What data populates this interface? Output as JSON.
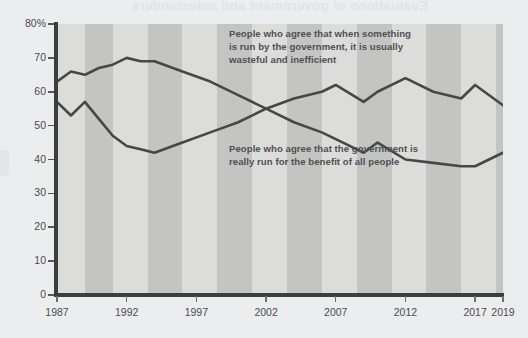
{
  "page": {
    "bleed_through_title": "Evaluations of government and sidestanders",
    "background_color": "#ecedee"
  },
  "chart_area": {
    "plot_background": "#d7d8d6",
    "band_light": "#dcdddb",
    "band_dark": "#c4c5c2",
    "axis_color": "#3d3d3d",
    "line_color": "#474749"
  },
  "annotations": {
    "upper": "People who agree that when something is run by the government, it is usually wasteful and inefficient",
    "lower": "People who agree that the government is really run for the benefit of all people"
  },
  "chart_data": {
    "type": "line",
    "title": "Evaluations of government and sidestanders",
    "xlabel": "",
    "ylabel": "",
    "ylim": [
      0,
      80
    ],
    "xlim": [
      1987,
      2019
    ],
    "grid": false,
    "legend": "annotations on plot",
    "y_ticks": [
      "0",
      "10",
      "20",
      "30",
      "40",
      "50",
      "60",
      "70",
      "80%"
    ],
    "y_tick_values": [
      0,
      10,
      20,
      30,
      40,
      50,
      60,
      70,
      80
    ],
    "x_ticks": [
      "1987",
      "1992",
      "1997",
      "2002",
      "2007",
      "2012",
      "2017",
      "2019"
    ],
    "x_tick_values": [
      1987,
      1992,
      1997,
      2002,
      2007,
      2012,
      2017,
      2019
    ],
    "series": [
      {
        "name": "People who agree that when something is run by the government, it is usually wasteful and inefficient",
        "color": "#474749",
        "x": [
          1987,
          1988,
          1989,
          1990,
          1991,
          1992,
          1993,
          1994,
          1996,
          1998,
          2000,
          2002,
          2004,
          2006,
          2008,
          2009,
          2010,
          2012,
          2014,
          2016,
          2017,
          2019
        ],
        "values": [
          63,
          66,
          65,
          67,
          68,
          70,
          69,
          69,
          66,
          63,
          59,
          55,
          51,
          48,
          44,
          42,
          45,
          40,
          39,
          38,
          38,
          42
        ]
      },
      {
        "name": "People who agree that the government is really run for the benefit of all people",
        "color": "#474749",
        "x": [
          1987,
          1988,
          1989,
          1990,
          1991,
          1992,
          1993,
          1994,
          1996,
          1998,
          2000,
          2002,
          2004,
          2006,
          2007,
          2009,
          2010,
          2012,
          2014,
          2016,
          2017,
          2019
        ],
        "values": [
          57,
          53,
          57,
          52,
          47,
          44,
          43,
          42,
          45,
          48,
          51,
          55,
          58,
          60,
          62,
          57,
          60,
          64,
          60,
          58,
          62,
          56
        ]
      }
    ],
    "crossing_point": {
      "year": 2002,
      "value": 55
    }
  },
  "bands": [
    {
      "start": 1987,
      "end": 1989,
      "shade": "light"
    },
    {
      "start": 1989,
      "end": 1991,
      "shade": "dark"
    },
    {
      "start": 1991,
      "end": 1993.5,
      "shade": "light"
    },
    {
      "start": 1993.5,
      "end": 1996,
      "shade": "dark"
    },
    {
      "start": 1996,
      "end": 1998.5,
      "shade": "light"
    },
    {
      "start": 1998.5,
      "end": 2001,
      "shade": "dark"
    },
    {
      "start": 2001,
      "end": 2003.5,
      "shade": "light"
    },
    {
      "start": 2003.5,
      "end": 2006,
      "shade": "dark"
    },
    {
      "start": 2006,
      "end": 2008.5,
      "shade": "light"
    },
    {
      "start": 2008.5,
      "end": 2011,
      "shade": "dark"
    },
    {
      "start": 2011,
      "end": 2013.5,
      "shade": "light"
    },
    {
      "start": 2013.5,
      "end": 2016,
      "shade": "dark"
    },
    {
      "start": 2016,
      "end": 2018.5,
      "shade": "light"
    },
    {
      "start": 2018.5,
      "end": 2019,
      "shade": "dark"
    }
  ]
}
